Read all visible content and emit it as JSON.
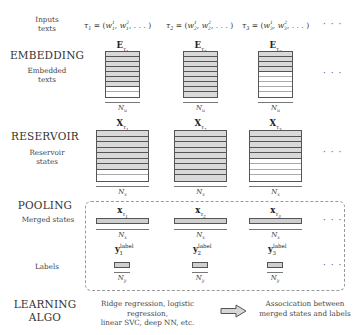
{
  "sections": {
    "inputs": {
      "title": "Inputs",
      "subtitle": "texts"
    },
    "embedding": {
      "title": "EMBEDDING",
      "subtitle_line1": "Embedded",
      "subtitle_line2": "texts"
    },
    "reservoir": {
      "title": "RESERVOIR",
      "subtitle_line1": "Reservoir",
      "subtitle_line2": "states"
    },
    "pooling": {
      "title": "POOLING",
      "merged_label": "Merged states",
      "labels_label": "Labels"
    },
    "learning": {
      "title_line1": "LEARNING",
      "title_line2": "ALGO"
    }
  },
  "inputs": [
    {
      "tau": "τ",
      "idx": "1",
      "expr_open": " = (",
      "w": "w",
      "sup1": "1",
      "sub1": "1",
      "sup2": "2",
      "sub2": "1",
      "expr_close": ", . . . )"
    },
    {
      "tau": "τ",
      "idx": "2",
      "expr_open": " = (",
      "w": "w",
      "sup1": "1",
      "sub1": "2",
      "sup2": "2",
      "sub2": "2",
      "expr_close": ", . . . )"
    },
    {
      "tau": "τ",
      "idx": "3",
      "expr_open": " = (",
      "w": "w",
      "sup1": "1",
      "sub1": "3",
      "sup2": "2",
      "sub2": "3",
      "expr_close": ", . . . )"
    }
  ],
  "ellipsis": "· · ·",
  "embedding_matrices": [
    {
      "symbol": "E",
      "sub": "τ",
      "subidx": "1",
      "dim": "N",
      "dimsub": "u",
      "filled_rows": 7,
      "total_rows": 9
    },
    {
      "symbol": "E",
      "sub": "τ",
      "subidx": "2",
      "dim": "N",
      "dimsub": "u",
      "filled_rows": 9,
      "total_rows": 9
    },
    {
      "symbol": "E",
      "sub": "τ",
      "subidx": "3",
      "dim": "N",
      "dimsub": "u",
      "filled_rows": 4,
      "total_rows": 9
    }
  ],
  "reservoir_matrices": [
    {
      "symbol": "X",
      "sub": "τ",
      "subidx": "1",
      "dim": "N",
      "dimsub": "x",
      "filled_rows": 7,
      "total_rows": 9
    },
    {
      "symbol": "X",
      "sub": "τ",
      "subidx": "2",
      "dim": "N",
      "dimsub": "x",
      "filled_rows": 9,
      "total_rows": 9
    },
    {
      "symbol": "X",
      "sub": "τ",
      "subidx": "3",
      "dim": "N",
      "dimsub": "x",
      "filled_rows": 5,
      "total_rows": 9
    }
  ],
  "merged_states": [
    {
      "symbol": "x",
      "sub": "τ",
      "subidx": "1",
      "dim": "N",
      "dimsub": "x"
    },
    {
      "symbol": "x",
      "sub": "τ",
      "subidx": "2",
      "dim": "N",
      "dimsub": "x"
    },
    {
      "symbol": "x",
      "sub": "τ",
      "subidx": "3",
      "dim": "N",
      "dimsub": "x"
    }
  ],
  "labels": [
    {
      "symbol": "y",
      "sub": "1",
      "sup": "label",
      "dim": "N",
      "dimsub": "y"
    },
    {
      "symbol": "y",
      "sub": "2",
      "sup": "label",
      "dim": "N",
      "dimsub": "y"
    },
    {
      "symbol": "y",
      "sub": "3",
      "sup": "label",
      "dim": "N",
      "dimsub": "y"
    }
  ],
  "learning": {
    "methods_line1": "Ridge regression, logistic regression,",
    "methods_line2": "linear SVC, deep NN, etc.",
    "result_line1": "Assocication between",
    "result_line2": "merged states and labels"
  },
  "colors": {
    "fill": "#d9d9d9",
    "stroke": "#555555",
    "dash": "#999999"
  }
}
